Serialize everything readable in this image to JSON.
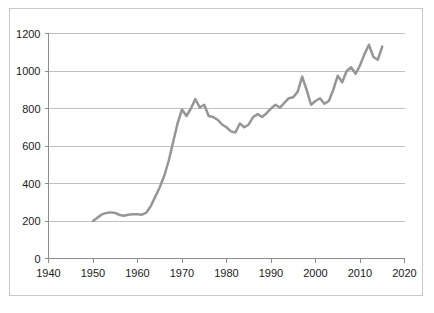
{
  "chart_data": {
    "type": "line",
    "title": "",
    "subtitle": "",
    "xlabel": "",
    "ylabel": "",
    "xlim": [
      1940,
      2020
    ],
    "ylim": [
      0,
      1200
    ],
    "xticks": [
      1940,
      1950,
      1960,
      1970,
      1980,
      1990,
      2000,
      2010,
      2020
    ],
    "yticks": [
      0,
      200,
      400,
      600,
      800,
      1000,
      1200
    ],
    "xtick_labels": [
      "1940",
      "1950",
      "1960",
      "1970",
      "1980",
      "1990",
      "2000",
      "2010",
      "2020"
    ],
    "ytick_labels": [
      "0",
      "200",
      "400",
      "600",
      "800",
      "1000",
      "1200"
    ],
    "grid": "horizontal",
    "legend": "none",
    "annotations": [],
    "series": [
      {
        "name": "series-1",
        "color": "#969696",
        "line_width": 2.5,
        "markers": "none",
        "x": [
          1950,
          1951,
          1952,
          1953,
          1954,
          1955,
          1956,
          1957,
          1958,
          1959,
          1960,
          1961,
          1962,
          1963,
          1964,
          1965,
          1966,
          1967,
          1968,
          1969,
          1970,
          1971,
          1972,
          1973,
          1974,
          1975,
          1976,
          1977,
          1978,
          1979,
          1980,
          1981,
          1982,
          1983,
          1984,
          1985,
          1986,
          1987,
          1988,
          1989,
          1990,
          1991,
          1992,
          1993,
          1994,
          1995,
          1996,
          1997,
          1998,
          1999,
          2000,
          2001,
          2002,
          2003,
          2004,
          2005,
          2006,
          2007,
          2008,
          2009,
          2010,
          2011,
          2012,
          2013,
          2014,
          2015
        ],
        "y": [
          200,
          218,
          235,
          243,
          246,
          243,
          232,
          228,
          234,
          236,
          236,
          234,
          245,
          280,
          330,
          380,
          440,
          520,
          620,
          720,
          795,
          760,
          800,
          850,
          805,
          820,
          760,
          755,
          740,
          715,
          700,
          678,
          672,
          720,
          700,
          715,
          755,
          770,
          755,
          775,
          800,
          820,
          805,
          830,
          855,
          860,
          890,
          970,
          900,
          820,
          840,
          855,
          825,
          840,
          900,
          975,
          940,
          1000,
          1020,
          985,
          1030,
          1090,
          1140,
          1075,
          1060,
          1130
        ]
      }
    ]
  },
  "axes": {
    "y_axis_name": "value-axis",
    "x_axis_name": "year-axis"
  },
  "colors": {
    "line": "#969696",
    "grid": "#c0c0c0",
    "axis": "#8c8c8c",
    "frame": "#c9c9c9",
    "text": "#1a1a1a",
    "background": "#ffffff"
  }
}
